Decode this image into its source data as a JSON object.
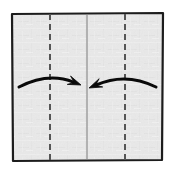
{
  "diagram": {
    "canvas": {
      "width": 174,
      "height": 170,
      "background": "#ffffff"
    },
    "paper": {
      "name": "square-sheet",
      "fill": "#e8e8e8",
      "texture_fill": "#f1f1f1",
      "stroke": "#1c1c1c",
      "stroke_width": 2.2,
      "x": 12,
      "y": 13,
      "width": 151,
      "height": 148,
      "corners": {
        "top_left": [
          12,
          14
        ],
        "top_right": [
          163,
          13
        ],
        "bottom_right": [
          162,
          160
        ],
        "bottom_left": [
          13,
          161
        ]
      }
    },
    "center_line": {
      "name": "center-crease",
      "type": "solid",
      "color": "#9a9a9a",
      "stroke_width": 1.4,
      "x": 87,
      "y_top": 15,
      "y_bottom": 159
    },
    "fold_lines": [
      {
        "name": "left-fold-crease",
        "type": "dashed",
        "color": "#555555",
        "stroke_width": 2.0,
        "dash": "6 4",
        "x": 50,
        "y_top": 14,
        "y_bottom": 160
      },
      {
        "name": "right-fold-crease",
        "type": "dashed",
        "color": "#555555",
        "stroke_width": 2.0,
        "dash": "6 4",
        "x": 125,
        "y_top": 14,
        "y_bottom": 160
      }
    ],
    "arrows": [
      {
        "name": "left-fold-arrow",
        "direction": "right",
        "color": "#0a0a0a",
        "stroke_width": 3.0,
        "tail": [
          19,
          87
        ],
        "control": [
          48,
          72
        ],
        "tip": [
          81,
          85
        ],
        "head_length": 13,
        "head_width": 9
      },
      {
        "name": "right-fold-arrow",
        "direction": "left",
        "color": "#0a0a0a",
        "stroke_width": 3.0,
        "tail": [
          156,
          87
        ],
        "control": [
          126,
          72
        ],
        "tip": [
          89,
          88
        ],
        "head_length": 13,
        "head_width": 9
      }
    ],
    "labels": []
  }
}
